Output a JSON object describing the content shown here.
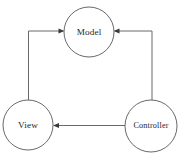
{
  "diagram": {
    "title": "Model View Controller",
    "background_color": "#ffffff",
    "stroke_color": "#57575c",
    "text_color": "#26262a",
    "nodes": [
      {
        "id": "model",
        "label": "Model",
        "cx": 89,
        "cy": 32,
        "r": 25
      },
      {
        "id": "view",
        "label": "View",
        "cx": 28,
        "cy": 125,
        "r": 25
      },
      {
        "id": "controller",
        "label": "Controller",
        "cx": 151,
        "cy": 126,
        "r": 26
      }
    ],
    "edges": [
      {
        "id": "controller-to-model",
        "from": "Controller",
        "to": "Model",
        "direction": "to-model",
        "arrow": "left"
      },
      {
        "id": "view-to-model",
        "from": "View",
        "to": "Model",
        "direction": "to-model",
        "arrow": "right"
      },
      {
        "id": "controller-to-view",
        "from": "Controller",
        "to": "View",
        "direction": "to-view",
        "arrow": "left"
      }
    ]
  }
}
